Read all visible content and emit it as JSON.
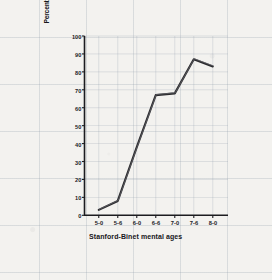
{
  "chart_data": {
    "type": "line",
    "title": "",
    "xlabel": "Stanford-Binet mental ages",
    "ylabel": "Percentages of children making satisfactory progress in reading",
    "ylabel_lines": [
      "Percentages of children making satisfactory",
      "progress in reading"
    ],
    "categories": [
      "5-0",
      "5-6",
      "6-0",
      "6-6",
      "7-0",
      "7-6",
      "8-0"
    ],
    "values": [
      3,
      8,
      38,
      67,
      68,
      87,
      83
    ],
    "series": [
      {
        "name": "Percentage making satisfactory progress in reading",
        "values": [
          3,
          8,
          38,
          67,
          68,
          87,
          83
        ]
      }
    ],
    "ylim": [
      0,
      100
    ],
    "yticks": [
      0,
      10,
      20,
      30,
      40,
      50,
      60,
      70,
      80,
      90,
      100
    ],
    "ytick_labels": [
      "0",
      "10",
      "20",
      "30",
      "40",
      "50",
      "60",
      "70",
      "80",
      "90",
      "100"
    ],
    "xtick_labels": [
      "5-0",
      "5-6",
      "6-0",
      "6-6",
      "7-0",
      "7-6",
      "8-0"
    ],
    "grid": true,
    "legend": "none",
    "line_color": "#2b2b2e",
    "grid_color": "#96a0af",
    "axis_color": "#1c1c20",
    "background_color": "#f3f2ef"
  }
}
